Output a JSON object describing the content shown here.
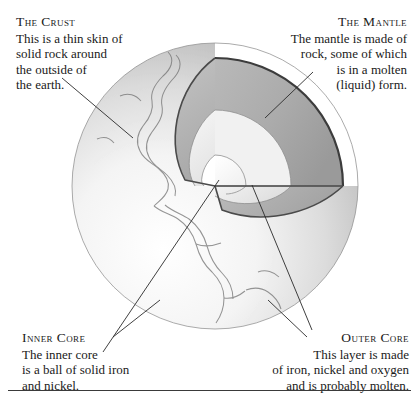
{
  "figure": {
    "sphere": {
      "center_x": 215,
      "center_y": 186,
      "radius": 143
    },
    "colors": {
      "crust_line": "#3c3c3c",
      "surface_light": "#fbfbfb",
      "surface_mid": "#d2d2d2",
      "surface_shadow": "#a9a9a9",
      "mantle_face": "#b4b4b4",
      "mantle_face_dark": "#9d9d9d",
      "outer_core_face": "#f1f1f1",
      "inner_core_face": "#ffffff",
      "continent_outline": "#6e6e6e",
      "leader_line": "#2a2a2a"
    }
  },
  "callouts": {
    "crust": {
      "title": "The Crust",
      "lines": [
        "This is a thin skin of",
        "solid rock around",
        "the outside of",
        "the earth."
      ]
    },
    "mantle": {
      "title": "The Mantle",
      "lines": [
        "The mantle is made of",
        "rock, some of which",
        "is in a molten",
        "(liquid) form."
      ]
    },
    "inner_core": {
      "title": "Inner Core",
      "lines": [
        "The inner core",
        "is a ball of solid iron",
        "and nickel."
      ]
    },
    "outer_core": {
      "title": "Outer Core",
      "lines": [
        "This layer is made",
        "of iron, nickel and oxygen",
        "and is probably molten."
      ]
    }
  }
}
